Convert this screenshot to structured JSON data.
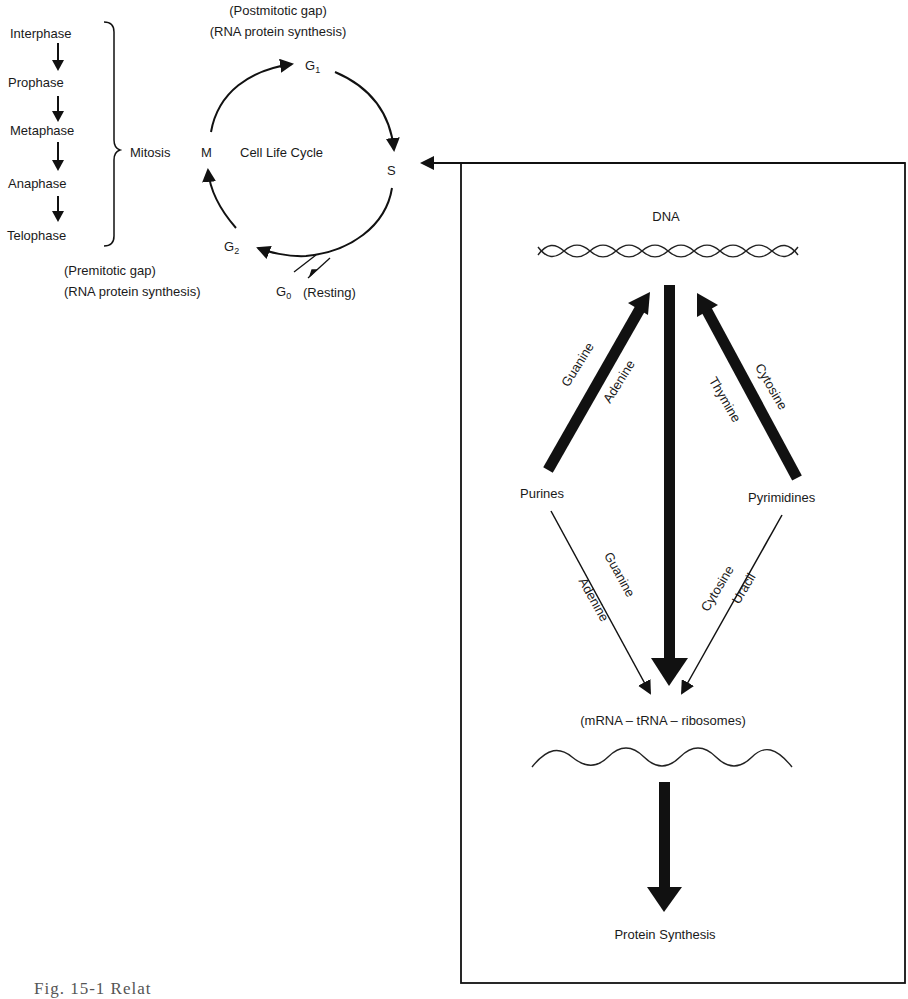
{
  "cell_cycle": {
    "phases_list": [
      "Interphase",
      "Prophase",
      "Metaphase",
      "Anaphase",
      "Telophase"
    ],
    "bracket_label": "Mitosis",
    "center_label": "Cell Life Cycle",
    "nodes": {
      "M": "M",
      "G1": "G",
      "G1_sub": "1",
      "S": "S",
      "G2": "G",
      "G2_sub": "2",
      "G0": "G",
      "G0_sub": "0",
      "G0_note": "(Resting)"
    },
    "g1_note_line1": "(Postmitotic gap)",
    "g1_note_line2": "(RNA protein synthesis)",
    "g2_note_line1": "(Premitotic gap)",
    "g2_note_line2": "(RNA protein synthesis)"
  },
  "synthesis_box": {
    "dna_label": "DNA",
    "purines_label": "Purines",
    "pyrimidines_label": "Pyrimidines",
    "purines_to_dna": [
      "Guanine",
      "Adenine"
    ],
    "pyrimidines_to_dna": [
      "Cytosine",
      "Thymine"
    ],
    "purines_to_rna": [
      "Guanine",
      "Adenine"
    ],
    "pyrimidines_to_rna": [
      "Cytosine",
      "Uracil"
    ],
    "rna_label": "(mRNA – tRNA – ribosomes)",
    "output_label": "Protein Synthesis"
  },
  "caption": "Fig. 15-1  Relat"
}
